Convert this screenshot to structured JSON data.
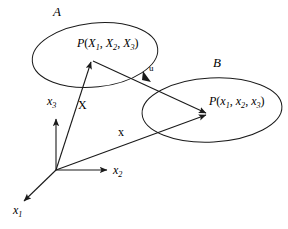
{
  "figure": {
    "background_color": "#ffffff",
    "stroke_color": "#1a1a1a",
    "width": 288,
    "height": 229
  },
  "sets": [
    {
      "id": "A",
      "label": "A",
      "role": "reference-configuration",
      "cx": 95,
      "cy": 55,
      "rx": 63,
      "ry": 33,
      "rotation": -6
    },
    {
      "id": "B",
      "label": "B",
      "role": "current-configuration",
      "cx": 212,
      "cy": 110,
      "rx": 70,
      "ry": 33,
      "rotation": -3
    }
  ],
  "points": [
    {
      "id": "P-material",
      "name": "P",
      "args": [
        "X1",
        "X2",
        "X3"
      ],
      "x": 92,
      "y": 60
    },
    {
      "id": "P-spatial",
      "name": "P",
      "args": [
        "x1",
        "x2",
        "x3"
      ],
      "x": 208,
      "y": 114
    }
  ],
  "origin": {
    "x": 56,
    "y": 170
  },
  "axes": [
    {
      "id": "x1",
      "label": "x",
      "subscript": "1",
      "tip_x": 22,
      "tip_y": 203
    },
    {
      "id": "x2",
      "label": "x",
      "subscript": "2",
      "tip_x": 108,
      "tip_y": 170
    },
    {
      "id": "x3",
      "label": "x",
      "subscript": "3",
      "tip_x": 56,
      "tip_y": 117
    }
  ],
  "vectors": [
    {
      "id": "X",
      "label": "X",
      "style": "upright-bold-serif",
      "from_x": 56,
      "from_y": 170,
      "to_x": 91,
      "to_y": 60,
      "label_x": 78,
      "label_y": 99
    },
    {
      "id": "x",
      "label": "x",
      "style": "upright-bold-serif",
      "from_x": 56,
      "from_y": 170,
      "to_x": 207,
      "to_y": 115,
      "label_x": 118,
      "label_y": 126
    },
    {
      "id": "u",
      "label": "u",
      "style": "upright-bold-serif",
      "from_x": 92,
      "from_y": 61,
      "to_x": 207,
      "to_y": 113,
      "label_x": 149,
      "label_y": 64,
      "arrowhead_mid_x": 148,
      "arrowhead_mid_y": 79
    }
  ],
  "labels": {
    "set_a": "A",
    "set_b": "B",
    "vector_X": "X",
    "vector_x": "x",
    "vector_u": "u",
    "axis_x1_base": "x",
    "axis_x1_sub": "1",
    "axis_x2_base": "x",
    "axis_x2_sub": "2",
    "axis_x3_base": "x",
    "axis_x3_sub": "3",
    "P_material_name": "P",
    "P_material_open": "(",
    "P_material_a_base": "X",
    "P_material_a_sub": "1",
    "P_material_sep1": ", ",
    "P_material_b_base": "X",
    "P_material_b_sub": "2",
    "P_material_sep2": ", ",
    "P_material_c_base": "X",
    "P_material_c_sub": "3",
    "P_material_close": ")",
    "P_spatial_name": "P",
    "P_spatial_open": "(",
    "P_spatial_a_base": "x",
    "P_spatial_a_sub": "1",
    "P_spatial_sep1": ", ",
    "P_spatial_b_base": "x",
    "P_spatial_b_sub": "2",
    "P_spatial_sep2": ", ",
    "P_spatial_c_base": "x",
    "P_spatial_c_sub": "3",
    "P_spatial_close": ")"
  }
}
